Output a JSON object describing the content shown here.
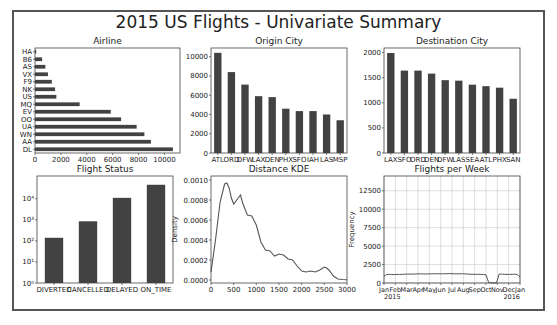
{
  "figure": {
    "title": "2015 US Flights - Univariate Summary",
    "frame_color": "#555555",
    "bar_color": "#424242",
    "line_color": "#555555"
  },
  "chart_data": [
    {
      "id": "airline",
      "type": "bar",
      "orientation": "horizontal",
      "title": "Airline",
      "xlabel": "",
      "ylabel": "",
      "categories": [
        "HA",
        "B6",
        "AS",
        "VX",
        "F9",
        "NK",
        "US",
        "MQ",
        "EV",
        "OO",
        "UA",
        "WN",
        "AA",
        "DL"
      ],
      "values": [
        90,
        550,
        800,
        1000,
        1300,
        1550,
        1650,
        3450,
        5850,
        6650,
        7850,
        8450,
        8950,
        10650
      ],
      "xticks": [
        "0",
        "2000",
        "4000",
        "6000",
        "8000",
        "10000"
      ],
      "xlim": [
        0,
        11200
      ],
      "grid": false
    },
    {
      "id": "origin_city",
      "type": "bar",
      "title": "Origin City",
      "xlabel": "",
      "ylabel": "",
      "categories": [
        "ATL",
        "ORD",
        "DFW",
        "LAX",
        "DEN",
        "PHX",
        "SFO",
        "IAH",
        "LAS",
        "MSP"
      ],
      "values": [
        10400,
        8400,
        7100,
        5900,
        5800,
        4600,
        4350,
        4350,
        4000,
        3400
      ],
      "yticks": [
        "0",
        "2000",
        "4000",
        "6000",
        "8000",
        "10000"
      ],
      "ylim": [
        0,
        10900
      ],
      "grid": false
    },
    {
      "id": "destination_city",
      "type": "bar",
      "title": "Destination City",
      "xlabel": "",
      "ylabel": "",
      "categories": [
        "LAX",
        "SFO",
        "ORD",
        "DEN",
        "DFW",
        "LAS",
        "SEA",
        "ATL",
        "PHX",
        "SAN"
      ],
      "values": [
        1990,
        1640,
        1640,
        1580,
        1450,
        1440,
        1360,
        1330,
        1300,
        1080
      ],
      "yticks": [
        "0",
        "500",
        "1000",
        "1500",
        "2000"
      ],
      "ylim": [
        0,
        2090
      ],
      "grid": false
    },
    {
      "id": "flight_status",
      "type": "bar",
      "title": "Flight Status",
      "yscale": "log",
      "xlabel": "",
      "ylabel": "",
      "categories": [
        "DIVERTED",
        "CANCELLED",
        "DELAYED",
        "ON_TIME"
      ],
      "values": [
        140,
        850,
        11000,
        46000
      ],
      "yticks": [
        "10⁰",
        "10¹",
        "10²",
        "10³",
        "10⁴"
      ],
      "ylim": [
        1,
        120000
      ],
      "grid": false
    },
    {
      "id": "distance_kde",
      "type": "line",
      "title": "Distance KDE",
      "xlabel": "",
      "ylabel": "Density",
      "x": [
        0,
        100,
        200,
        300,
        350,
        400,
        450,
        500,
        600,
        650,
        700,
        800,
        900,
        1000,
        1100,
        1200,
        1300,
        1400,
        1500,
        1600,
        1700,
        1800,
        1900,
        2000,
        2100,
        2200,
        2300,
        2400,
        2500,
        2550,
        2600,
        2700,
        2800,
        2900,
        3000
      ],
      "y": [
        8e-05,
        0.0004,
        0.00078,
        0.00096,
        0.00097,
        0.00092,
        0.00082,
        0.00076,
        0.00082,
        0.00085,
        0.00077,
        0.00065,
        0.00064,
        0.00055,
        0.00038,
        0.0003,
        0.00029,
        0.00024,
        0.00026,
        0.00025,
        0.00021,
        0.0002,
        0.00014,
        9e-05,
        8e-05,
        9e-05,
        8e-05,
        0.0001,
        0.00013,
        0.00012,
        0.0001,
        4e-05,
        1e-05,
        5e-06,
        2e-06
      ],
      "xticks": [
        "0",
        "500",
        "1000",
        "1500",
        "2000",
        "2500",
        "3000"
      ],
      "yticks": [
        "0.0000",
        "0.0002",
        "0.0004",
        "0.0006",
        "0.0008",
        "0.0010"
      ],
      "xlim": [
        0,
        3000
      ],
      "ylim": [
        -3e-05,
        0.00104
      ],
      "grid": false
    },
    {
      "id": "flights_per_week",
      "type": "line",
      "title": "Flights per Week",
      "xlabel": "",
      "ylabel": "Frequency",
      "x_weeks": 53,
      "y": [
        900,
        1150,
        1180,
        1150,
        1140,
        1160,
        1170,
        1180,
        1190,
        1200,
        1210,
        1200,
        1220,
        1230,
        1240,
        1230,
        1220,
        1230,
        1240,
        1250,
        1260,
        1250,
        1240,
        1250,
        1260,
        1270,
        1260,
        1250,
        1240,
        1250,
        1260,
        1230,
        1200,
        1190,
        1180,
        1170,
        1180,
        1170,
        1160,
        1100,
        100,
        20,
        20,
        20,
        1200,
        1210,
        1180,
        1160,
        1170,
        1180,
        1190,
        1150,
        800
      ],
      "xticks": [
        "Jan\n2015",
        "Feb",
        "Mar",
        "Apr",
        "May",
        "Jun",
        "Jul",
        "Aug",
        "Sep",
        "Oct",
        "Nov",
        "Dec",
        "Jan\n2016"
      ],
      "yticks": [
        "0",
        "2500",
        "5000",
        "7500",
        "10000",
        "12500"
      ],
      "ylim": [
        0,
        14500
      ],
      "grid": true
    }
  ]
}
